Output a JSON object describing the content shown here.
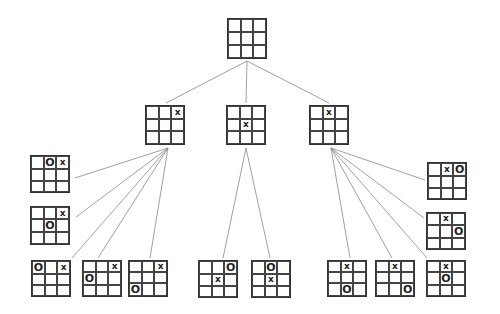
{
  "diagram": {
    "title": "",
    "type": "tic-tac-toe game tree",
    "line_color": "#888888",
    "nodes": [
      {
        "id": "root",
        "x": 227,
        "y": 18,
        "w": 40,
        "h": 41,
        "cells": [
          "",
          "",
          "",
          "",
          "",
          "",
          "",
          "",
          ""
        ]
      },
      {
        "id": "l1-corner",
        "x": 145,
        "y": 105,
        "w": 40,
        "h": 40,
        "cells": [
          "",
          "",
          "x",
          "",
          "",
          "",
          "",
          "",
          ""
        ]
      },
      {
        "id": "l1-center",
        "x": 226,
        "y": 105,
        "w": 40,
        "h": 40,
        "cells": [
          "",
          "",
          "",
          "",
          "x",
          "",
          "",
          "",
          ""
        ]
      },
      {
        "id": "l1-edge",
        "x": 309,
        "y": 105,
        "w": 40,
        "h": 40,
        "cells": [
          "",
          "x",
          "",
          "",
          "",
          "",
          "",
          "",
          ""
        ]
      },
      {
        "id": "l2-a",
        "x": 30,
        "y": 155,
        "w": 40,
        "h": 38,
        "cells": [
          "",
          "O",
          "x",
          "",
          "",
          "",
          "",
          "",
          ""
        ]
      },
      {
        "id": "l2-b",
        "x": 30,
        "y": 206,
        "w": 40,
        "h": 39,
        "cells": [
          "",
          "",
          "x",
          "",
          "O",
          "",
          "",
          "",
          ""
        ]
      },
      {
        "id": "l2-c",
        "x": 31,
        "y": 260,
        "w": 40,
        "h": 37,
        "cells": [
          "O",
          "",
          "x",
          "",
          "",
          "",
          "",
          "",
          ""
        ]
      },
      {
        "id": "l2-d",
        "x": 82,
        "y": 260,
        "w": 40,
        "h": 37,
        "cells": [
          "",
          "",
          "x",
          "O",
          "",
          "",
          "",
          "",
          ""
        ]
      },
      {
        "id": "l2-e",
        "x": 128,
        "y": 260,
        "w": 40,
        "h": 37,
        "cells": [
          "",
          "",
          "x",
          "",
          "",
          "",
          "O",
          "",
          ""
        ]
      },
      {
        "id": "l2-f",
        "x": 198,
        "y": 260,
        "w": 40,
        "h": 38,
        "cells": [
          "",
          "",
          "O",
          "",
          "x",
          "",
          "",
          "",
          ""
        ]
      },
      {
        "id": "l2-g",
        "x": 251,
        "y": 260,
        "w": 40,
        "h": 38,
        "cells": [
          "",
          "O",
          "",
          "",
          "x",
          "",
          "",
          "",
          ""
        ]
      },
      {
        "id": "l2-h",
        "x": 327,
        "y": 260,
        "w": 40,
        "h": 37,
        "cells": [
          "",
          "x",
          "",
          "",
          "",
          "",
          "",
          "O",
          ""
        ]
      },
      {
        "id": "l2-i",
        "x": 375,
        "y": 260,
        "w": 40,
        "h": 37,
        "cells": [
          "",
          "x",
          "",
          "",
          "",
          "",
          "",
          "",
          "O"
        ]
      },
      {
        "id": "l2-j",
        "x": 426,
        "y": 260,
        "w": 40,
        "h": 37,
        "cells": [
          "",
          "x",
          "",
          "",
          "O",
          "",
          "",
          "",
          ""
        ]
      },
      {
        "id": "l2-k",
        "x": 427,
        "y": 162,
        "w": 40,
        "h": 38,
        "cells": [
          "",
          "x",
          "O",
          "",
          "",
          "",
          "",
          "",
          ""
        ]
      },
      {
        "id": "l2-l",
        "x": 426,
        "y": 212,
        "w": 40,
        "h": 38,
        "cells": [
          "",
          "x",
          "",
          "",
          "",
          "O",
          "",
          "",
          ""
        ]
      }
    ],
    "edges": [
      [
        247,
        61,
        166,
        103
      ],
      [
        247,
        61,
        246,
        103
      ],
      [
        247,
        61,
        329,
        103
      ],
      [
        168,
        148,
        75,
        178
      ],
      [
        168,
        148,
        76,
        217
      ],
      [
        168,
        148,
        72,
        258
      ],
      [
        168,
        148,
        98,
        258
      ],
      [
        168,
        148,
        150,
        258
      ],
      [
        246,
        148,
        223,
        258
      ],
      [
        246,
        148,
        270,
        258
      ],
      [
        331,
        148,
        425,
        180
      ],
      [
        331,
        148,
        424,
        218
      ],
      [
        331,
        148,
        350,
        258
      ],
      [
        331,
        148,
        392,
        258
      ],
      [
        331,
        148,
        427,
        258
      ]
    ]
  }
}
